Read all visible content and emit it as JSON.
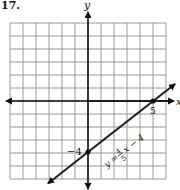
{
  "problem_number": "17.",
  "chart_data": {
    "type": "line",
    "title": "",
    "xlabel": "x",
    "ylabel": "y",
    "xlim": [
      -6,
      6
    ],
    "ylim": [
      -6,
      6
    ],
    "grid": true,
    "grid_step": 1,
    "series": [
      {
        "name": "y = 4/5 x - 4",
        "slope": 0.8,
        "intercept": -4,
        "x": [
          -3,
          0,
          5,
          6.7
        ],
        "y": [
          -6.4,
          -4,
          0,
          1.36
        ]
      }
    ],
    "points": [
      {
        "x": 0,
        "y": -4,
        "label": "−4"
      },
      {
        "x": 5,
        "y": 0,
        "label": "5"
      }
    ],
    "annotations": [
      {
        "text": "y = 4/5 x − 4",
        "lhs": "y =",
        "num": "4",
        "den": "5",
        "rhs": "x − 4"
      }
    ]
  },
  "labels": {
    "x_axis": "x",
    "y_axis": "y",
    "y_intercept": "−4",
    "x_intercept": "5",
    "eq_lhs": "y =",
    "eq_num": "4",
    "eq_den": "5",
    "eq_rhs": "x − 4"
  },
  "colors": {
    "grid": "#9a9a9a",
    "axes": "#111111",
    "line": "#222222"
  }
}
